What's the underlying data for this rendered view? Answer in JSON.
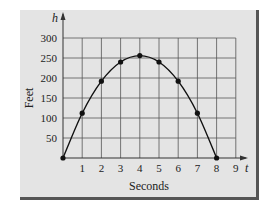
{
  "chart_data": {
    "type": "line",
    "title": "",
    "xlabel": "Seconds",
    "ylabel": "Feet",
    "x_axis_var": "t",
    "y_axis_var": "h",
    "x": [
      0,
      1,
      2,
      3,
      4,
      5,
      6,
      7,
      8
    ],
    "series": [
      {
        "name": "h",
        "values": [
          0,
          112,
          192,
          240,
          256,
          240,
          192,
          112,
          0
        ]
      }
    ],
    "xticks": [
      1,
      2,
      3,
      4,
      5,
      6,
      7,
      8,
      9
    ],
    "yticks": [
      50,
      100,
      150,
      200,
      250,
      300
    ],
    "xlim": [
      0,
      9
    ],
    "ylim": [
      0,
      300
    ],
    "grid": true,
    "legend": "none",
    "markers": true
  },
  "colors": {
    "panel_bg": "#e4e4e4",
    "grid": "#555555",
    "curve": "#111111",
    "border": "#555555"
  }
}
